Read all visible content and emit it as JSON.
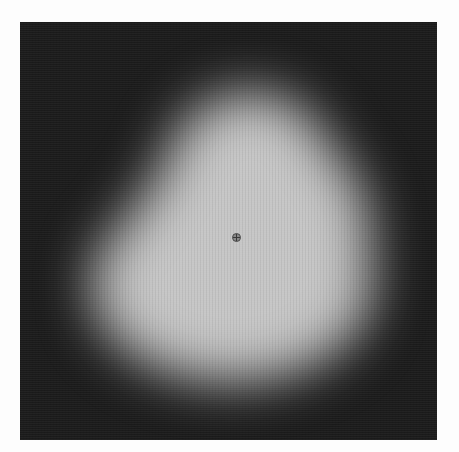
{
  "image": {
    "description": "Grayscale image of a soft, blurred pear-shaped bright blob on a dark noisy background with a small circular crosshair marker near the center",
    "background_color": "#1b1b1b",
    "blob_color": "#c6c6c6",
    "frame_color": "#ffffff",
    "marker": {
      "shape": "circle-crosshair",
      "x": 236,
      "y": 237
    }
  }
}
